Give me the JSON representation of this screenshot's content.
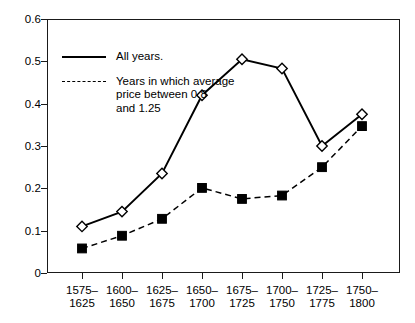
{
  "chart_data": {
    "type": "line",
    "title": "",
    "subtitle": "",
    "xlabel": "",
    "ylabel": "",
    "categories": [
      "1575–\n1625",
      "1600–\n1650",
      "1625–\n1675",
      "1650–\n1700",
      "1675–\n1725",
      "1700–\n1750",
      "1725–\n1775",
      "1750–\n1800"
    ],
    "ylim": [
      0,
      0.6
    ],
    "yticks": [
      "0",
      "0.1",
      "0.2",
      "0.3",
      "0.4",
      "0.5",
      "0.6"
    ],
    "ytick_values": [
      0,
      0.1,
      0.2,
      0.3,
      0.4,
      0.5,
      0.6
    ],
    "grid": false,
    "legend_position": "upper left",
    "series": [
      {
        "name": "All years.",
        "marker": "open-diamond",
        "linestyle": "solid",
        "color": "#000000",
        "values": [
          0.11,
          0.145,
          0.235,
          0.42,
          0.505,
          0.483,
          0.3,
          0.375
        ]
      },
      {
        "name": "Years in which average\nprice between 0.8\nand 1.25",
        "marker": "filled-square",
        "linestyle": "dashed",
        "color": "#000000",
        "values": [
          0.058,
          0.088,
          0.128,
          0.201,
          0.175,
          0.183,
          0.25,
          0.347
        ]
      }
    ]
  },
  "legend": {
    "items": [
      {
        "label": "All years."
      },
      {
        "label": "Years in which average\nprice between 0.8\nand 1.25"
      }
    ]
  }
}
